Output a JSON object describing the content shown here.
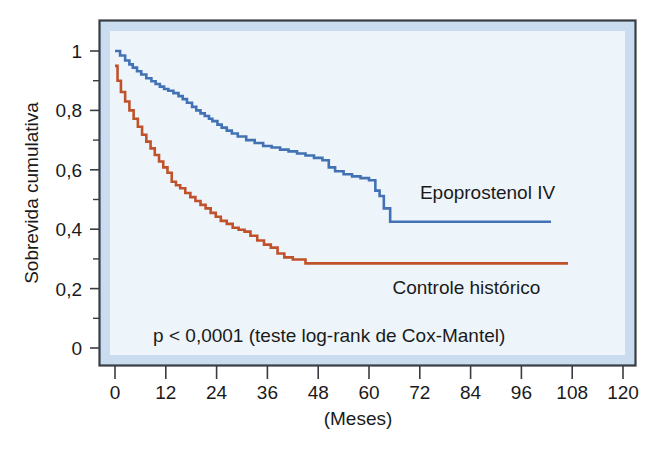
{
  "chart_data": {
    "type": "line",
    "title": "",
    "subtitle": "",
    "xlabel": "(Meses)",
    "ylabel": "Sobrevida cumulativa",
    "xlim": [
      0,
      120
    ],
    "ylim": [
      0,
      1.05
    ],
    "xticks": [
      "0",
      "12",
      "24",
      "36",
      "48",
      "60",
      "72",
      "84",
      "96",
      "108",
      "120"
    ],
    "xtick_values": [
      0,
      12,
      24,
      36,
      48,
      60,
      72,
      84,
      96,
      108,
      120
    ],
    "yticks": [
      "0",
      "0,2",
      "0,4",
      "0,6",
      "0,8",
      "1"
    ],
    "ytick_values": [
      0,
      0.2,
      0.4,
      0.6,
      0.8,
      1.0
    ],
    "yminor_values": [
      0.1,
      0.3,
      0.5,
      0.7,
      0.9
    ],
    "grid": false,
    "legend_position": "inline-right",
    "annotations": [
      {
        "name": "p-value-annotation",
        "text": "p < 0,0001 (teste log-rank de Cox-Mantel)",
        "x": 9,
        "y": 0.045
      }
    ],
    "series": [
      {
        "name": "Epoprostenol IV",
        "label": "Epoprostenol IV",
        "color": "#4372b4",
        "step": true,
        "label_x": 88,
        "label_y": 0.525,
        "x": [
          0,
          1.2,
          2.4,
          3.4,
          4.2,
          5.2,
          6.2,
          7.4,
          8.6,
          9.6,
          10.6,
          11.6,
          12.6,
          13.8,
          15.0,
          16.0,
          17.0,
          18.2,
          19.2,
          20.2,
          21.2,
          22.2,
          23.0,
          24.2,
          25.2,
          26.4,
          27.6,
          29.0,
          31.0,
          33.0,
          35.0,
          37.0,
          39.0,
          41.0,
          43.0,
          45.0,
          47.0,
          49.0,
          50.5,
          52.0,
          54.0,
          56.0,
          58.0,
          60.0,
          61.5,
          62.5,
          63.5,
          65.0,
          103.0
        ],
        "y": [
          1.0,
          0.985,
          0.968,
          0.955,
          0.944,
          0.932,
          0.921,
          0.908,
          0.898,
          0.889,
          0.88,
          0.872,
          0.866,
          0.858,
          0.848,
          0.838,
          0.826,
          0.812,
          0.8,
          0.79,
          0.781,
          0.772,
          0.764,
          0.752,
          0.742,
          0.732,
          0.722,
          0.712,
          0.7,
          0.69,
          0.68,
          0.675,
          0.668,
          0.662,
          0.655,
          0.648,
          0.64,
          0.632,
          0.608,
          0.595,
          0.585,
          0.578,
          0.572,
          0.565,
          0.53,
          0.512,
          0.47,
          0.425,
          0.425
        ]
      },
      {
        "name": "Controle historico",
        "label": "Controle histórico",
        "color": "#c0522b",
        "step": true,
        "label_x": 83,
        "label_y": 0.205,
        "x": [
          0,
          0.6,
          1.4,
          2.4,
          3.4,
          4.4,
          5.4,
          6.4,
          7.4,
          8.4,
          9.4,
          10.4,
          11.4,
          12.4,
          13.4,
          14.4,
          15.4,
          16.6,
          17.8,
          19.0,
          20.2,
          21.4,
          22.6,
          23.8,
          25.0,
          26.4,
          27.8,
          29.2,
          30.6,
          32.0,
          33.6,
          35.2,
          36.8,
          38.4,
          40.0,
          42.0,
          45.0,
          107.0
        ],
        "y": [
          0.95,
          0.9,
          0.862,
          0.83,
          0.8,
          0.772,
          0.745,
          0.718,
          0.695,
          0.672,
          0.65,
          0.628,
          0.608,
          0.59,
          0.56,
          0.548,
          0.538,
          0.522,
          0.508,
          0.495,
          0.482,
          0.47,
          0.455,
          0.442,
          0.428,
          0.418,
          0.405,
          0.398,
          0.392,
          0.378,
          0.362,
          0.348,
          0.338,
          0.318,
          0.305,
          0.298,
          0.285,
          0.285
        ]
      }
    ]
  },
  "style": {
    "frame_border_color": "#3a3c44",
    "plot_band_color": "#c9dcf0",
    "plot_bg_color": "#edf5fb",
    "page_bg_color": "#ffffff",
    "tick_color": "#3a3c44",
    "text_color": "#1a1a1a"
  }
}
